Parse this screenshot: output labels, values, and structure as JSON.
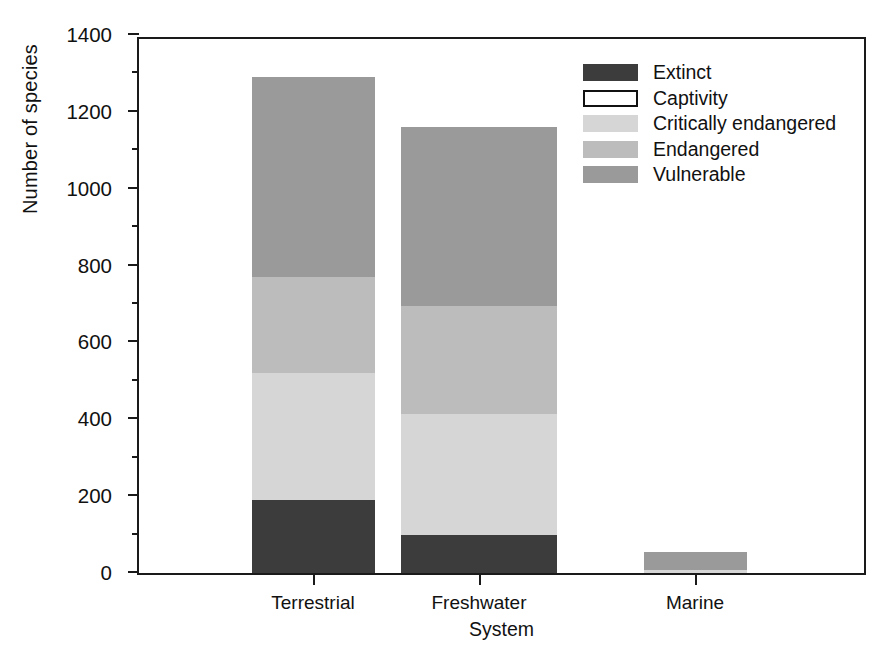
{
  "chart_data": {
    "type": "bar",
    "stacked": true,
    "title": "",
    "xlabel": "System",
    "ylabel": "Number of species",
    "categories": [
      "Terrestrial",
      "Freshwater",
      "Marine"
    ],
    "ylim": [
      0,
      1400
    ],
    "y_ticks": [
      0,
      200,
      400,
      600,
      800,
      1000,
      1200,
      1400
    ],
    "y_tick_labels": [
      "0",
      "200",
      "400",
      "600",
      "800",
      "1000",
      "1200",
      "1400"
    ],
    "y_minor_ticks": [
      100,
      300,
      500,
      700,
      900,
      1100,
      1300
    ],
    "grid": false,
    "legend_position": "top-right",
    "series": [
      {
        "name": "Extinct",
        "color": "#3c3c3c",
        "values": [
          190,
          100,
          0
        ]
      },
      {
        "name": "Captivity",
        "color": "#ffffff",
        "values": [
          0,
          0,
          0
        ]
      },
      {
        "name": "Critically endangered",
        "color": "#d6d6d6",
        "values": [
          330,
          315,
          8
        ]
      },
      {
        "name": "Endangered",
        "color": "#bcbcbc",
        "values": [
          250,
          280,
          0
        ]
      },
      {
        "name": "Vulnerable",
        "color": "#9a9a9a",
        "values": [
          520,
          465,
          47
        ]
      }
    ],
    "totals": [
      1290,
      1160,
      55
    ]
  },
  "legend": {
    "items": [
      {
        "label": "Extinct",
        "swatch": "solid"
      },
      {
        "label": "Captivity",
        "swatch": "outline"
      },
      {
        "label": "Critically endangered",
        "swatch": "solid"
      },
      {
        "label": "Endangered",
        "swatch": "solid"
      },
      {
        "label": "Vulnerable",
        "swatch": "solid"
      }
    ]
  }
}
